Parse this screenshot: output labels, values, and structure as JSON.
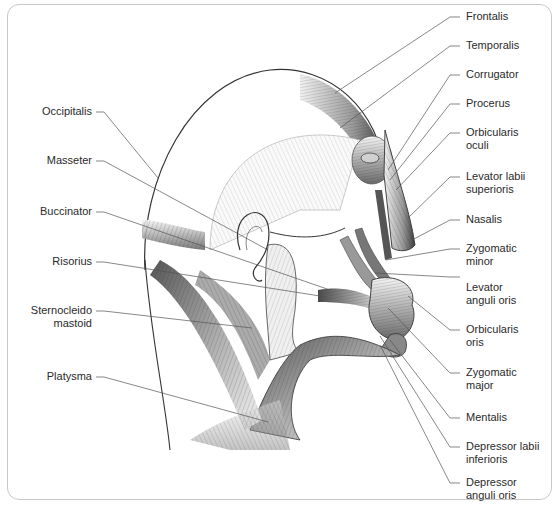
{
  "diagram": {
    "colors": {
      "frame_border": "#c8c8c8",
      "leader_line": "#555555",
      "muscle_dark": "#3a3a3a",
      "muscle_light": "#e6e6e6",
      "outline": "#333333",
      "label_text": "#2a2a2a"
    },
    "labels_left": [
      {
        "id": "occipitalis",
        "lines": [
          "Occipitalis"
        ]
      },
      {
        "id": "masseter",
        "lines": [
          "Masseter"
        ]
      },
      {
        "id": "buccinator",
        "lines": [
          "Buccinator"
        ]
      },
      {
        "id": "risorius",
        "lines": [
          "Risorius"
        ]
      },
      {
        "id": "sternocleidomastoid",
        "lines": [
          "Sternocleido",
          "mastoid"
        ]
      },
      {
        "id": "platysma",
        "lines": [
          "Platysma"
        ]
      }
    ],
    "labels_right": [
      {
        "id": "frontalis",
        "lines": [
          "Frontalis"
        ]
      },
      {
        "id": "temporalis",
        "lines": [
          "Temporalis"
        ]
      },
      {
        "id": "corrugator",
        "lines": [
          "Corrugator"
        ]
      },
      {
        "id": "procerus",
        "lines": [
          "Procerus"
        ]
      },
      {
        "id": "orbicularis-oculi",
        "lines": [
          "Orbicularis",
          "oculi"
        ]
      },
      {
        "id": "levator-labii-superioris",
        "lines": [
          "Levator labii",
          "superioris"
        ]
      },
      {
        "id": "nasalis",
        "lines": [
          "Nasalis"
        ]
      },
      {
        "id": "zygomatic-minor",
        "lines": [
          "Zygomatic",
          "minor"
        ]
      },
      {
        "id": "levator-anguli-oris",
        "lines": [
          "Levator",
          "anguli oris"
        ]
      },
      {
        "id": "orbicularis-oris",
        "lines": [
          "Orbicularis",
          "oris"
        ]
      },
      {
        "id": "zygomatic-major",
        "lines": [
          "Zygomatic",
          "major"
        ]
      },
      {
        "id": "mentalis",
        "lines": [
          "Mentalis"
        ]
      },
      {
        "id": "depressor-labii-inferioris",
        "lines": [
          "Depressor labii",
          "inferioris"
        ]
      },
      {
        "id": "depressor-anguli-oris",
        "lines": [
          "Depressor",
          "anguli oris"
        ]
      }
    ]
  }
}
